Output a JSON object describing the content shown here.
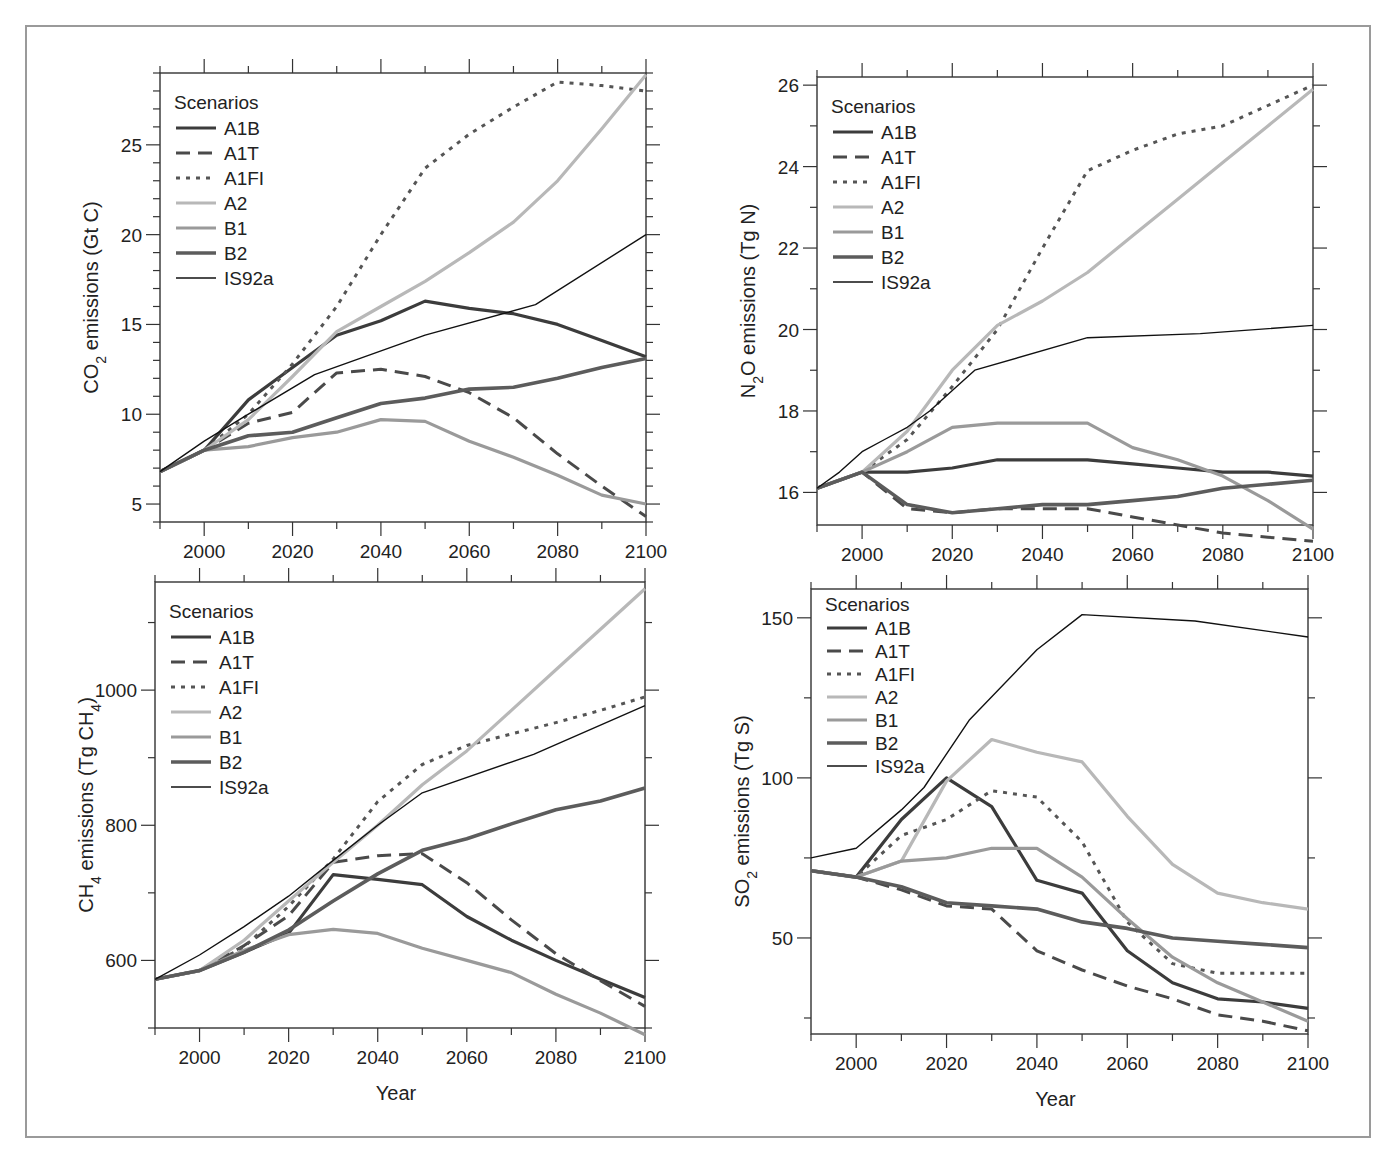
{
  "figure": {
    "legend_title": "Scenarios",
    "xlabel": "Year",
    "series_styles": [
      {
        "name": "A1B",
        "color": "#3c3c3c",
        "width": 3.2,
        "dash": ""
      },
      {
        "name": "A1T",
        "color": "#4a4a4a",
        "width": 3.0,
        "dash": "14,8"
      },
      {
        "name": "A1FI",
        "color": "#555555",
        "width": 3.0,
        "dash": "4,6"
      },
      {
        "name": "A2",
        "color": "#b8b8b8",
        "width": 3.2,
        "dash": ""
      },
      {
        "name": "B1",
        "color": "#9a9a9a",
        "width": 3.2,
        "dash": ""
      },
      {
        "name": "B2",
        "color": "#5c5c5c",
        "width": 3.6,
        "dash": ""
      },
      {
        "name": "IS92a",
        "color": "#111111",
        "width": 1.4,
        "dash": ""
      }
    ]
  },
  "chart_data": [
    {
      "type": "line",
      "id": "co2",
      "title": "",
      "ylabel_main": "CO",
      "ylabel_sub": "2",
      "ylabel_rest": " emissions (Gt C)",
      "xlabel": "",
      "x_ticks": [
        2000,
        2020,
        2040,
        2060,
        2080,
        2100
      ],
      "y_ticks": [
        5,
        10,
        15,
        20,
        25
      ],
      "xlim": [
        1990,
        2100
      ],
      "ylim": [
        4,
        29
      ],
      "legend_position": "upper-left",
      "grid": false,
      "box": {
        "left": 160,
        "top": 73,
        "right": 646,
        "bottom": 522
      },
      "series": [
        {
          "name": "A1B",
          "x": [
            1990,
            2000,
            2010,
            2020,
            2030,
            2040,
            2050,
            2060,
            2070,
            2080,
            2090,
            2100
          ],
          "y": [
            6.8,
            8.0,
            10.8,
            12.6,
            14.4,
            15.2,
            16.3,
            15.9,
            15.6,
            15.0,
            14.1,
            13.2
          ]
        },
        {
          "name": "A1T",
          "x": [
            1990,
            2000,
            2010,
            2020,
            2030,
            2040,
            2050,
            2060,
            2070,
            2080,
            2090,
            2100
          ],
          "y": [
            6.8,
            8.0,
            9.5,
            10.1,
            12.3,
            12.5,
            12.1,
            11.2,
            9.8,
            7.8,
            6.0,
            4.3
          ]
        },
        {
          "name": "A1FI",
          "x": [
            1990,
            2000,
            2010,
            2020,
            2030,
            2040,
            2050,
            2060,
            2070,
            2080,
            2090,
            2100
          ],
          "y": [
            6.8,
            8.0,
            10.0,
            12.8,
            16.0,
            20.0,
            23.7,
            25.6,
            27.1,
            28.5,
            28.3,
            28.0
          ]
        },
        {
          "name": "A2",
          "x": [
            1990,
            2000,
            2010,
            2020,
            2030,
            2040,
            2050,
            2060,
            2070,
            2080,
            2090,
            2100
          ],
          "y": [
            6.8,
            8.0,
            9.7,
            12.1,
            14.6,
            16.0,
            17.4,
            19.0,
            20.7,
            23.0,
            25.9,
            28.9
          ]
        },
        {
          "name": "B1",
          "x": [
            1990,
            2000,
            2010,
            2020,
            2030,
            2040,
            2050,
            2060,
            2070,
            2080,
            2090,
            2100
          ],
          "y": [
            6.8,
            8.0,
            8.2,
            8.7,
            9.0,
            9.7,
            9.6,
            8.5,
            7.6,
            6.6,
            5.5,
            5.0
          ]
        },
        {
          "name": "B2",
          "x": [
            1990,
            2000,
            2010,
            2020,
            2030,
            2040,
            2050,
            2060,
            2070,
            2080,
            2090,
            2100
          ],
          "y": [
            6.8,
            8.0,
            8.8,
            9.0,
            9.8,
            10.6,
            10.9,
            11.4,
            11.5,
            12.0,
            12.6,
            13.1
          ]
        },
        {
          "name": "IS92a",
          "x": [
            1990,
            2000,
            2010,
            2025,
            2050,
            2075,
            2100
          ],
          "y": [
            6.8,
            8.5,
            10.0,
            12.2,
            14.4,
            16.1,
            20.0
          ]
        }
      ]
    },
    {
      "type": "line",
      "id": "n2o",
      "title": "",
      "ylabel_main": "N",
      "ylabel_sub": "2",
      "ylabel_rest": "O emissions (Tg N)",
      "xlabel": "",
      "x_ticks": [
        2000,
        2020,
        2040,
        2060,
        2080,
        2100
      ],
      "y_ticks": [
        16,
        18,
        20,
        22,
        24,
        26
      ],
      "xlim": [
        1990,
        2100
      ],
      "ylim": [
        15.2,
        26.2
      ],
      "legend_position": "upper-left",
      "grid": false,
      "box": {
        "left": 817,
        "top": 77,
        "right": 1313,
        "bottom": 525
      },
      "series": [
        {
          "name": "A1B",
          "x": [
            1990,
            2000,
            2010,
            2020,
            2030,
            2040,
            2050,
            2060,
            2070,
            2080,
            2090,
            2100
          ],
          "y": [
            16.1,
            16.5,
            16.5,
            16.6,
            16.8,
            16.8,
            16.8,
            16.7,
            16.6,
            16.5,
            16.5,
            16.4
          ]
        },
        {
          "name": "A1T",
          "x": [
            1990,
            2000,
            2010,
            2020,
            2030,
            2040,
            2050,
            2060,
            2070,
            2080,
            2090,
            2100
          ],
          "y": [
            16.1,
            16.5,
            15.6,
            15.5,
            15.6,
            15.6,
            15.6,
            15.4,
            15.2,
            15.0,
            14.9,
            14.8
          ]
        },
        {
          "name": "A1FI",
          "x": [
            1990,
            2000,
            2010,
            2020,
            2030,
            2040,
            2050,
            2060,
            2070,
            2080,
            2090,
            2100
          ],
          "y": [
            16.1,
            16.5,
            17.3,
            18.6,
            20.0,
            22.0,
            23.9,
            24.4,
            24.8,
            25.0,
            25.5,
            26.0
          ]
        },
        {
          "name": "A2",
          "x": [
            1990,
            2000,
            2010,
            2020,
            2030,
            2040,
            2050,
            2060,
            2070,
            2080,
            2090,
            2100
          ],
          "y": [
            16.1,
            16.5,
            17.5,
            19.0,
            20.1,
            20.7,
            21.4,
            22.3,
            23.2,
            24.1,
            25.0,
            25.9
          ]
        },
        {
          "name": "B1",
          "x": [
            1990,
            2000,
            2010,
            2020,
            2030,
            2040,
            2050,
            2060,
            2070,
            2080,
            2090,
            2100
          ],
          "y": [
            16.1,
            16.5,
            17.0,
            17.6,
            17.7,
            17.7,
            17.7,
            17.1,
            16.8,
            16.4,
            15.8,
            15.1
          ]
        },
        {
          "name": "B2",
          "x": [
            1990,
            2000,
            2010,
            2020,
            2030,
            2040,
            2050,
            2060,
            2070,
            2080,
            2090,
            2100
          ],
          "y": [
            16.1,
            16.5,
            15.7,
            15.5,
            15.6,
            15.7,
            15.7,
            15.8,
            15.9,
            16.1,
            16.2,
            16.3
          ]
        },
        {
          "name": "IS92a",
          "x": [
            1990,
            1995,
            2000,
            2005,
            2010,
            2015,
            2020,
            2025,
            2050,
            2075,
            2100
          ],
          "y": [
            16.1,
            16.5,
            17.0,
            17.3,
            17.6,
            18.0,
            18.5,
            19.0,
            19.8,
            19.9,
            20.1
          ]
        }
      ]
    },
    {
      "type": "line",
      "id": "ch4",
      "title": "",
      "ylabel_main": "CH",
      "ylabel_sub": "4",
      "ylabel_rest": " emissions (Tg CH",
      "ylabel_sub2": "4",
      "ylabel_end": ")",
      "xlabel": "Year",
      "x_ticks": [
        2000,
        2020,
        2040,
        2060,
        2080,
        2100
      ],
      "y_ticks": [
        600,
        800,
        1000
      ],
      "xlim": [
        1990,
        2100
      ],
      "ylim": [
        500,
        1160
      ],
      "legend_position": "upper-left",
      "grid": false,
      "box": {
        "left": 155,
        "top": 582,
        "right": 645,
        "bottom": 1028
      },
      "series": [
        {
          "name": "A1B",
          "x": [
            1990,
            2000,
            2010,
            2020,
            2030,
            2040,
            2050,
            2060,
            2070,
            2080,
            2090,
            2100
          ],
          "y": [
            572,
            585,
            612,
            640,
            727,
            720,
            712,
            665,
            630,
            600,
            572,
            545
          ]
        },
        {
          "name": "A1T",
          "x": [
            1990,
            2000,
            2010,
            2020,
            2030,
            2040,
            2050,
            2060,
            2070,
            2080,
            2090,
            2100
          ],
          "y": [
            572,
            585,
            622,
            666,
            745,
            755,
            758,
            715,
            660,
            610,
            570,
            532
          ]
        },
        {
          "name": "A1FI",
          "x": [
            1990,
            2000,
            2010,
            2020,
            2030,
            2040,
            2050,
            2060,
            2070,
            2080,
            2090,
            2100
          ],
          "y": [
            572,
            585,
            620,
            680,
            750,
            835,
            890,
            918,
            935,
            952,
            970,
            990
          ]
        },
        {
          "name": "A2",
          "x": [
            1990,
            2000,
            2010,
            2020,
            2030,
            2040,
            2050,
            2060,
            2070,
            2080,
            2090,
            2100
          ],
          "y": [
            572,
            585,
            630,
            688,
            745,
            800,
            860,
            910,
            970,
            1030,
            1090,
            1150
          ]
        },
        {
          "name": "B1",
          "x": [
            1990,
            2000,
            2010,
            2020,
            2030,
            2040,
            2050,
            2060,
            2070,
            2080,
            2090,
            2100
          ],
          "y": [
            572,
            585,
            615,
            638,
            646,
            640,
            618,
            600,
            582,
            550,
            522,
            490
          ]
        },
        {
          "name": "B2",
          "x": [
            1990,
            2000,
            2010,
            2020,
            2030,
            2040,
            2050,
            2060,
            2070,
            2080,
            2090,
            2100
          ],
          "y": [
            572,
            585,
            612,
            645,
            688,
            728,
            763,
            780,
            802,
            823,
            836,
            855
          ]
        },
        {
          "name": "IS92a",
          "x": [
            1990,
            2000,
            2010,
            2020,
            2030,
            2040,
            2050,
            2075,
            2100
          ],
          "y": [
            572,
            608,
            650,
            695,
            748,
            800,
            848,
            905,
            977
          ]
        }
      ]
    },
    {
      "type": "line",
      "id": "so2",
      "title": "",
      "ylabel_main": "SO",
      "ylabel_sub": "2",
      "ylabel_rest": " emissions (Tg S)",
      "xlabel": "Year",
      "x_ticks": [
        2000,
        2020,
        2040,
        2060,
        2080,
        2100
      ],
      "y_ticks": [
        50,
        100,
        150
      ],
      "xlim": [
        1990,
        2100
      ],
      "ylim": [
        20,
        159
      ],
      "legend_position": "upper-left",
      "grid": false,
      "box": {
        "left": 811,
        "top": 589,
        "right": 1308,
        "bottom": 1034
      },
      "series": [
        {
          "name": "A1B",
          "x": [
            1990,
            2000,
            2010,
            2020,
            2030,
            2040,
            2050,
            2060,
            2070,
            2080,
            2090,
            2100
          ],
          "y": [
            71,
            69,
            87,
            100,
            91,
            68,
            64,
            46,
            36,
            31,
            30,
            28
          ]
        },
        {
          "name": "A1T",
          "x": [
            1990,
            2000,
            2010,
            2020,
            2030,
            2040,
            2050,
            2060,
            2070,
            2080,
            2090,
            2100
          ],
          "y": [
            71,
            69,
            65,
            60,
            59,
            46,
            40,
            35,
            31,
            26,
            24,
            21
          ]
        },
        {
          "name": "A1FI",
          "x": [
            1990,
            2000,
            2010,
            2020,
            2030,
            2040,
            2050,
            2060,
            2070,
            2080,
            2090,
            2100
          ],
          "y": [
            71,
            69,
            82,
            87,
            96,
            94,
            80,
            55,
            42,
            39,
            39,
            39
          ]
        },
        {
          "name": "A2",
          "x": [
            1990,
            2000,
            2010,
            2020,
            2030,
            2040,
            2050,
            2060,
            2070,
            2080,
            2090,
            2100
          ],
          "y": [
            71,
            69,
            74,
            99,
            112,
            108,
            105,
            88,
            73,
            64,
            61,
            59
          ]
        },
        {
          "name": "B1",
          "x": [
            1990,
            2000,
            2010,
            2020,
            2030,
            2040,
            2050,
            2060,
            2070,
            2080,
            2090,
            2100
          ],
          "y": [
            71,
            69,
            74,
            75,
            78,
            78,
            69,
            56,
            44,
            36,
            30,
            24
          ]
        },
        {
          "name": "B2",
          "x": [
            1990,
            2000,
            2010,
            2020,
            2030,
            2040,
            2050,
            2060,
            2070,
            2080,
            2090,
            2100
          ],
          "y": [
            71,
            69,
            66,
            61,
            60,
            59,
            55,
            53,
            50,
            49,
            48,
            47
          ]
        },
        {
          "name": "IS92a",
          "x": [
            1990,
            2000,
            2010,
            2015,
            2025,
            2040,
            2050,
            2075,
            2100
          ],
          "y": [
            75,
            78,
            90,
            97,
            118,
            140,
            151,
            149,
            144
          ]
        }
      ]
    }
  ]
}
